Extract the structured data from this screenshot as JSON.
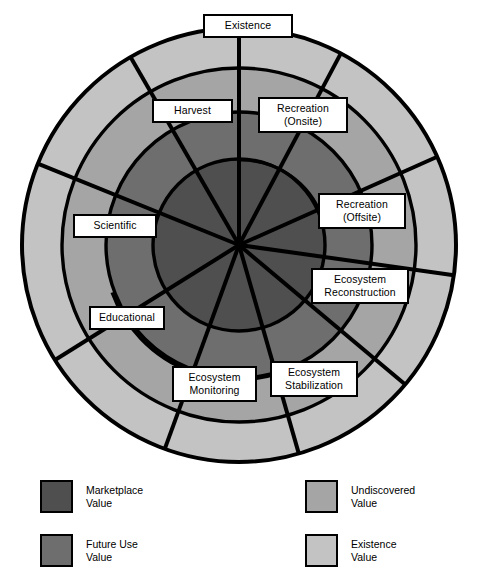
{
  "diagram": {
    "type": "concentric-ring-segment-diagram",
    "center": {
      "x": 239,
      "y": 245
    },
    "rings": [
      {
        "name": "Marketplace Value",
        "color": "#4f4f4f",
        "outer_radius": 86
      },
      {
        "name": "Future Use Value",
        "color": "#6e6e6e",
        "outer_radius": 133
      },
      {
        "name": "Undiscovered Value",
        "color": "#a5a5a5",
        "outer_radius": 177
      },
      {
        "name": "Existence Value",
        "color": "#c3c3c3",
        "outer_radius": 217
      }
    ],
    "spoke_angles_deg": [
      90,
      62,
      24,
      352,
      320,
      286,
      250,
      212,
      158,
      120
    ],
    "segments": [
      "Recreation (Onsite)",
      "Recreation (Offsite)",
      "Ecosystem Reconstruction",
      "Ecosystem Stabilization",
      "Ecosystem Monitoring",
      "Educational",
      "Scientific",
      "Harvest",
      "Existence"
    ],
    "labels": [
      {
        "id": "existence",
        "line1": "Existence",
        "line2": "",
        "x": 203,
        "y": 14,
        "w": 90,
        "h": 23
      },
      {
        "id": "harvest",
        "line1": "Harvest",
        "line2": "",
        "x": 152,
        "y": 99,
        "w": 81,
        "h": 23
      },
      {
        "id": "recreation-onsite",
        "line1": "Recreation",
        "line2": "(Onsite)",
        "x": 258,
        "y": 97,
        "w": 90,
        "h": 35
      },
      {
        "id": "recreation-offsite",
        "line1": "Recreation",
        "line2": "(Offsite)",
        "x": 318,
        "y": 193,
        "w": 88,
        "h": 35
      },
      {
        "id": "ecosystem-reconstruction",
        "line1": "Ecosystem",
        "line2": "Reconstruction",
        "x": 311,
        "y": 268,
        "w": 98,
        "h": 35
      },
      {
        "id": "scientific",
        "line1": "Scientific",
        "line2": "",
        "x": 73,
        "y": 214,
        "w": 84,
        "h": 23
      },
      {
        "id": "educational",
        "line1": "Educational",
        "line2": "",
        "x": 89,
        "y": 306,
        "w": 76,
        "h": 23
      },
      {
        "id": "ecosystem-monitoring",
        "line1": "Ecosystem",
        "line2": "Monitoring",
        "x": 172,
        "y": 366,
        "w": 85,
        "h": 35
      },
      {
        "id": "ecosystem-stabilization",
        "line1": "Ecosystem",
        "line2": "Stabilization",
        "x": 270,
        "y": 361,
        "w": 88,
        "h": 35
      }
    ]
  },
  "legend": {
    "items": [
      {
        "id": "marketplace",
        "line1": "Marketplace",
        "line2": "Value",
        "color": "#4f4f4f",
        "x": 40,
        "y": 8
      },
      {
        "id": "future-use",
        "line1": "Future Use",
        "line2": "Value",
        "color": "#6e6e6e",
        "x": 40,
        "y": 62
      },
      {
        "id": "undiscovered",
        "line1": "Undiscovered",
        "line2": "Value",
        "color": "#a5a5a5",
        "x": 305,
        "y": 8
      },
      {
        "id": "existence",
        "line1": "Existence",
        "line2": "Value",
        "color": "#c3c3c3",
        "x": 305,
        "y": 62
      }
    ]
  }
}
